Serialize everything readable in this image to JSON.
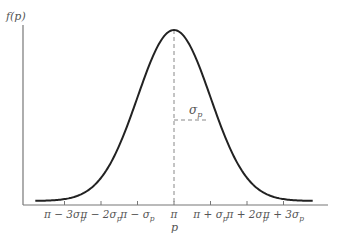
{
  "chart_data": {
    "type": "line",
    "title": "",
    "ylabel": "f(p)",
    "xlabel": "p",
    "mean_label": "π",
    "sigma_annotation": "σp",
    "x_ticks": [
      "π − 3σp",
      "π − 2σp",
      "π − σp",
      "π",
      "π + σp",
      "π + 2σp",
      "π + 3σp"
    ],
    "x_tick_offsets_sigma": [
      -3,
      -2,
      -1,
      0,
      1,
      2,
      3
    ],
    "curve": {
      "distribution": "normal",
      "mean": 0,
      "sd": 1,
      "x_range_sigma": [
        -3.8,
        3.8
      ]
    },
    "grid": false,
    "legend": null,
    "colors": {
      "curve": "#222222",
      "axes": "#777777",
      "dashed": "#888888",
      "text": "#555555"
    }
  },
  "labels": {
    "y_axis": "f(p)",
    "x_axis_symbol": "p",
    "sigma": "σ",
    "sigma_sub": "p",
    "ticks": [
      {
        "main": "π − 3σ",
        "sub": "p"
      },
      {
        "main": "π − 2σ",
        "sub": "p"
      },
      {
        "main": "π − σ",
        "sub": "p"
      },
      {
        "main": "π",
        "sub": ""
      },
      {
        "main": "π + σ",
        "sub": "p"
      },
      {
        "main": "π + 2σ",
        "sub": "p"
      },
      {
        "main": "π + 3σ",
        "sub": "p"
      }
    ]
  }
}
